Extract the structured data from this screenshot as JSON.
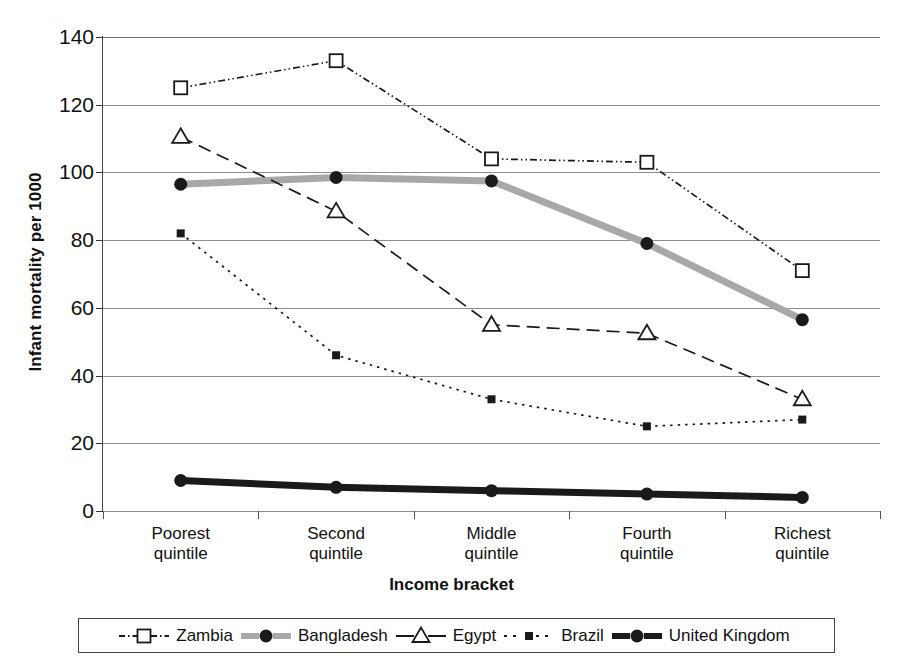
{
  "axes": {
    "ylabel": "Infant mortality per 1000",
    "xlabel": "Income bracket",
    "yticks": [
      "0",
      "20",
      "40",
      "60",
      "80",
      "100",
      "120",
      "140"
    ]
  },
  "categories": [
    {
      "line1": "Poorest",
      "line2": "quintile"
    },
    {
      "line1": "Second",
      "line2": "quintile"
    },
    {
      "line1": "Middle",
      "line2": "quintile"
    },
    {
      "line1": "Fourth",
      "line2": "quintile"
    },
    {
      "line1": "Richest",
      "line2": "quintile"
    }
  ],
  "legend": [
    {
      "label": "Zambia",
      "marker": "open-square-icon",
      "style": "dash-dot",
      "color": "#1a1a1a"
    },
    {
      "label": "Bangladesh",
      "marker": "filled-circle-icon",
      "style": "solid-thick-gray",
      "color": "#a8a8a8"
    },
    {
      "label": "Egypt",
      "marker": "open-triangle-icon",
      "style": "dashed",
      "color": "#1a1a1a"
    },
    {
      "label": "Brazil",
      "marker": "small-square-icon",
      "style": "dotted",
      "color": "#1a1a1a"
    },
    {
      "label": "United Kingdom",
      "marker": "filled-circle-icon",
      "style": "solid-thick-black",
      "color": "#1a1a1a"
    }
  ],
  "chart_data": {
    "type": "line",
    "title": "",
    "xlabel": "Income bracket",
    "ylabel": "Infant mortality per 1000",
    "categories": [
      "Poorest quintile",
      "Second quintile",
      "Middle quintile",
      "Fourth quintile",
      "Richest quintile"
    ],
    "ylim": [
      0,
      140
    ],
    "ytick_step": 20,
    "grid": true,
    "legend_position": "bottom",
    "series": [
      {
        "name": "Zambia",
        "values": [
          125,
          133,
          104,
          103,
          71
        ],
        "color": "#1a1a1a",
        "marker": "open-square",
        "linestyle": "dash-dot"
      },
      {
        "name": "Bangladesh",
        "values": [
          96.5,
          98.5,
          97.5,
          79,
          56.5
        ],
        "color": "#a8a8a8",
        "marker": "filled-circle",
        "linestyle": "solid-thick"
      },
      {
        "name": "Egypt",
        "values": [
          110.5,
          88.5,
          55,
          52.5,
          33
        ],
        "color": "#1a1a1a",
        "marker": "open-triangle",
        "linestyle": "dashed"
      },
      {
        "name": "Brazil",
        "values": [
          82,
          46,
          33,
          25,
          27
        ],
        "color": "#1a1a1a",
        "marker": "small-square",
        "linestyle": "dotted"
      },
      {
        "name": "United Kingdom",
        "values": [
          9,
          7,
          6,
          5,
          4
        ],
        "color": "#1a1a1a",
        "marker": "filled-circle",
        "linestyle": "solid-thick"
      }
    ]
  }
}
